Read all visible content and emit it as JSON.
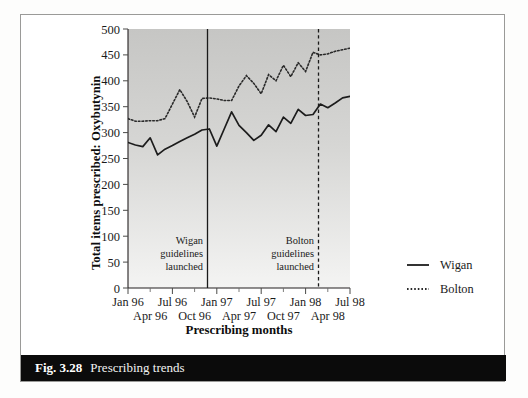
{
  "figure": {
    "number_label": "Fig. 3.28",
    "caption": "Prescribing trends"
  },
  "chart_data": {
    "type": "line",
    "title": "",
    "xlabel": "Prescribing months",
    "ylabel": "Total items prescribed: Oxybutynin",
    "ylim": [
      0,
      500
    ],
    "ytick_labels": [
      "0",
      "50",
      "100",
      "150",
      "200",
      "250",
      "300",
      "350",
      "400",
      "450",
      "500"
    ],
    "ytick_values": [
      0,
      50,
      100,
      150,
      200,
      250,
      300,
      350,
      400,
      450,
      500
    ],
    "xtick_labels_upper": [
      "Jan 96",
      "Jul 96",
      "Jan 97",
      "Jul 97",
      "Jan 98",
      "Jul 98"
    ],
    "xtick_labels_lower": [
      "Apr 96",
      "Oct 96",
      "Apr 97",
      "Oct 97",
      "Apr 98"
    ],
    "grid": false,
    "legend_position": "right",
    "x": [
      "Jan 96",
      "Feb 96",
      "Mar 96",
      "Apr 96",
      "May 96",
      "Jun 96",
      "Jul 96",
      "Aug 96",
      "Sep 96",
      "Oct 96",
      "Nov 96",
      "Dec 96",
      "Jan 97",
      "Feb 97",
      "Mar 97",
      "Apr 97",
      "May 97",
      "Jun 97",
      "Jul 97",
      "Aug 97",
      "Sep 97",
      "Oct 97",
      "Nov 97",
      "Dec 97",
      "Jan 98",
      "Feb 98",
      "Mar 98",
      "Apr 98",
      "May 98",
      "Jun 98",
      "Jul 98"
    ],
    "series": [
      {
        "name": "Wigan",
        "style": "solid",
        "color": "#1c1c1c",
        "values": [
          281,
          276,
          273,
          290,
          257,
          268,
          275,
          283,
          290,
          297,
          305,
          307,
          274,
          307,
          340,
          314,
          300,
          285,
          295,
          315,
          302,
          330,
          318,
          345,
          333,
          335,
          355,
          348,
          357,
          367,
          370
        ]
      },
      {
        "name": "Bolton",
        "style": "dotted",
        "color": "#2a2a2a",
        "values": [
          327,
          322,
          322,
          323,
          323,
          327,
          355,
          383,
          360,
          330,
          366,
          367,
          365,
          362,
          362,
          390,
          410,
          395,
          375,
          412,
          400,
          430,
          408,
          435,
          418,
          455,
          450,
          452,
          457,
          460,
          463
        ]
      }
    ],
    "annotations": [
      {
        "id": "wigan-guidelines",
        "lines": [
          "Wigan",
          "guidelines",
          "launched"
        ],
        "at_x": "Jan 97",
        "line_style": "solid"
      },
      {
        "id": "bolton-guidelines",
        "lines": [
          "Bolton",
          "guidelines",
          "launched"
        ],
        "at_x": "Jan 98",
        "line_style": "dashed"
      }
    ],
    "legend": [
      {
        "label": "Wigan",
        "style": "solid"
      },
      {
        "label": "Bolton",
        "style": "dotted"
      }
    ]
  }
}
